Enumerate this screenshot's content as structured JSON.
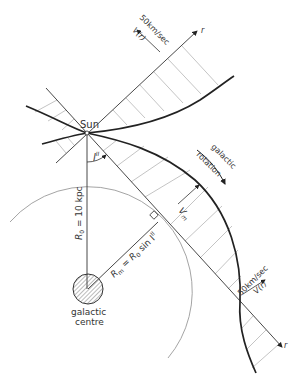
{
  "diagram": {
    "labels": {
      "sun": "Sun",
      "galactic_longitude": "l",
      "galactic_longitude_sup": "II",
      "r0": "R",
      "r0_sub": "0",
      "r0_value": " = 10 kpc",
      "rm": "R",
      "rm_sub": "m",
      "rm_formula": " = R",
      "rm_formula_sub": "0",
      "rm_formula_tail": " sin l",
      "rm_formula_sup": "II",
      "vm": "V",
      "vm_sub": "m",
      "galactic_centre_line1": "galactic",
      "galactic_centre_line2": "centre",
      "rotation_line1": "galactic",
      "rotation_line2": "rotation",
      "scale_top": "50km/sec",
      "vr_top": "V(r)",
      "scale_bottom": "50km/sec",
      "vr_bottom": "V(r)",
      "r_axis_top": "r",
      "r_axis_bottom": "r"
    },
    "colors": {
      "ink": "#222222",
      "hatch": "#b0b0b0",
      "orbit": "#9a9a9a"
    }
  }
}
